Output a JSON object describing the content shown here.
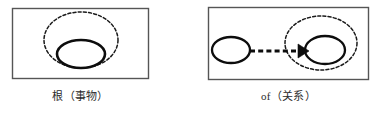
{
  "figure": {
    "background_color": "#ffffff",
    "stroke_color": "#1a1a1a",
    "panel_border_color": "#555555",
    "panels": [
      {
        "id": "root-panel",
        "caption": "根（事物）",
        "box": {
          "x": 12,
          "y": 8,
          "width": 136,
          "height": 70
        },
        "shapes": [
          {
            "name": "outer-dashed-ellipse",
            "kind": "ellipse",
            "style": "dashed",
            "cx": 81,
            "cy": 40,
            "rx": 37,
            "ry": 28
          },
          {
            "name": "inner-solid-ellipse",
            "kind": "ellipse",
            "style": "solid",
            "cx": 81,
            "cy": 54,
            "rx": 24,
            "ry": 14
          }
        ]
      },
      {
        "id": "of-panel",
        "caption": "of（关系）",
        "box": {
          "x": 208,
          "y": 7,
          "width": 160,
          "height": 72
        },
        "shapes": [
          {
            "name": "source-solid-ellipse",
            "kind": "ellipse",
            "style": "solid",
            "cx": 231,
            "cy": 50,
            "rx": 19,
            "ry": 13
          },
          {
            "name": "outer-dashed-ellipse",
            "kind": "ellipse",
            "style": "dashed",
            "cx": 321,
            "cy": 43,
            "rx": 36,
            "ry": 27
          },
          {
            "name": "target-solid-ellipse",
            "kind": "ellipse",
            "style": "solid",
            "cx": 325,
            "cy": 50,
            "rx": 20,
            "ry": 14
          },
          {
            "name": "dashed-arrow",
            "kind": "arrow",
            "style": "dashed",
            "x1": 250,
            "y1": 51,
            "x2": 307,
            "y2": 51
          }
        ]
      }
    ]
  }
}
